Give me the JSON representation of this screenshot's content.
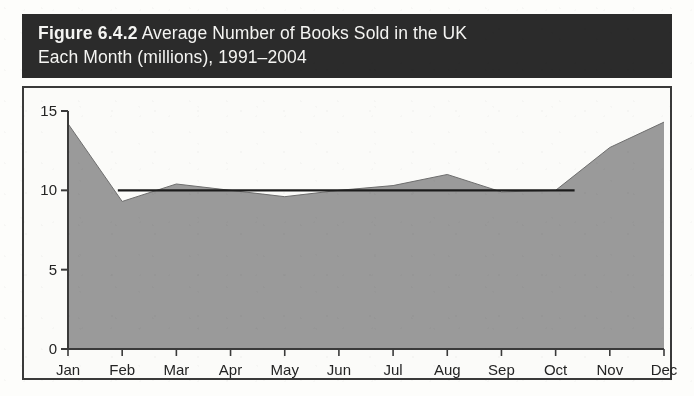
{
  "figure": {
    "label": "Figure 6.4.2",
    "caption": "Average Number of Books Sold in the UK Each Month (millions), 1991–2004",
    "title_line_1_strong": "Figure 6.4.2",
    "title_line_1_rest": " Average Number of Books Sold in the UK",
    "title_line_2": "Each Month (millions), 1991–2004",
    "header_background": "#2b2b2b",
    "header_text_color": "#f4f4f2"
  },
  "colors": {
    "area_fill": "#9a9a9a",
    "area_line": "#6e6e6e",
    "axis": "#3a3a3a",
    "reference_line": "#1c1c1c",
    "plot_background": "#fbfbf9",
    "page_background": "#fdfdfb"
  },
  "chart_data": {
    "type": "area",
    "title": "Figure 6.4.2 Average Number of Books Sold in the UK Each Month (millions), 1991–2004",
    "xlabel": "",
    "ylabel": "",
    "categories": [
      "Jan",
      "Feb",
      "Mar",
      "Apr",
      "May",
      "Jun",
      "Jul",
      "Aug",
      "Sep",
      "Oct",
      "Nov",
      "Dec"
    ],
    "values": [
      14.2,
      9.3,
      10.4,
      10.0,
      9.6,
      10.0,
      10.3,
      11.0,
      9.9,
      10.0,
      12.7,
      14.3
    ],
    "series": [
      {
        "name": "Average books sold (millions)",
        "values": [
          14.2,
          9.3,
          10.4,
          10.0,
          9.6,
          10.0,
          10.3,
          11.0,
          9.9,
          10.0,
          12.7,
          14.3
        ]
      }
    ],
    "ylim": [
      0,
      15
    ],
    "yticks": [
      0,
      5,
      10,
      15
    ],
    "ytick_labels": [
      "0",
      "5",
      "10",
      "15"
    ],
    "xtick_labels": [
      "Jan",
      "Feb",
      "Mar",
      "Apr",
      "May",
      "Jun",
      "Jul",
      "Aug",
      "Sep",
      "Oct",
      "Nov",
      "Dec"
    ],
    "grid": false,
    "legend": "none",
    "annotations": [
      {
        "type": "reference-line",
        "orientation": "horizontal",
        "value": 10,
        "label": "10 million reference line"
      }
    ],
    "units": "millions of books"
  }
}
